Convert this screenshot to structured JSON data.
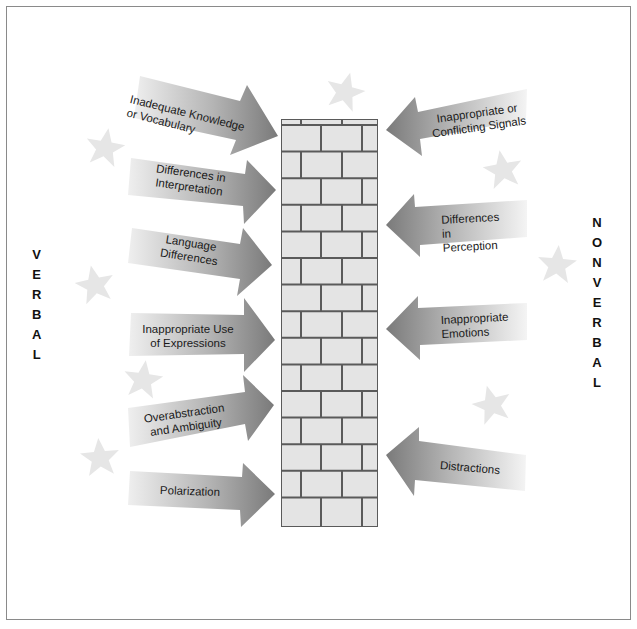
{
  "diagram": {
    "left_label": "VERBAL",
    "right_label": "NONVERBAL",
    "left_label_letters": [
      "V",
      "E",
      "R",
      "B",
      "A",
      "L"
    ],
    "right_label_letters": [
      "N",
      "O",
      "N",
      "V",
      "E",
      "R",
      "B",
      "A",
      "L"
    ],
    "center_element": "brick-wall",
    "colors": {
      "arrow_dark": "#7d7d7d",
      "arrow_light": "#f2f2f2",
      "brick_fill": "#e4e4e4",
      "mortar": "#5a5a5a",
      "star": "#e8e8e8",
      "frame": "#8a8a8a"
    },
    "verbal_barriers": [
      {
        "label": "Inadequate Knowledge\nor Vocabulary"
      },
      {
        "label": "Differences in\nInterpretation"
      },
      {
        "label": "Language\nDifferences"
      },
      {
        "label": "Inappropriate Use\nof Expressions"
      },
      {
        "label": "Overabstraction\nand Ambiguity"
      },
      {
        "label": "Polarization"
      }
    ],
    "nonverbal_barriers": [
      {
        "label": "Inappropriate or\nConflicting Signals"
      },
      {
        "label": "Differences in\nPerception"
      },
      {
        "label": "Inappropriate\nEmotions"
      },
      {
        "label": "Distractions"
      }
    ]
  }
}
